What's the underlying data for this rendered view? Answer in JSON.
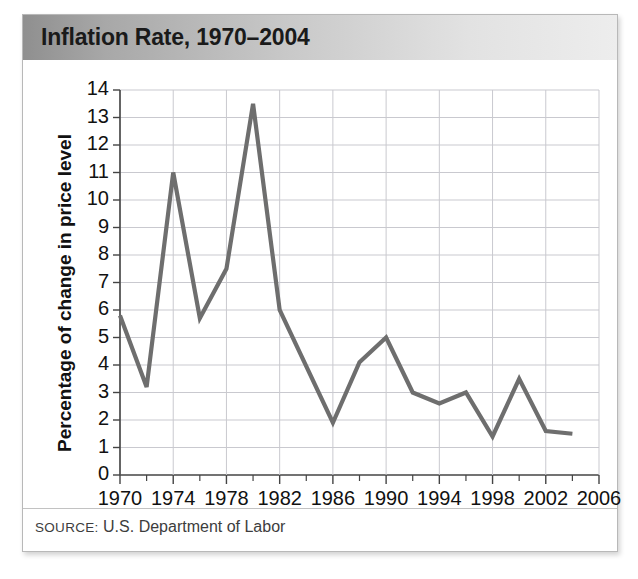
{
  "figure": {
    "title": "Inflation Rate, 1970–2004",
    "source_label": "SOURCE:",
    "source_text": "U.S. Department of Labor",
    "accent_line_color": "#6e6e6e",
    "grid_color": "#c9c9cf",
    "axis_color": "#444444",
    "title_bar_left_color": "#8f8f8f",
    "title_bar_right_color": "#ededed"
  },
  "chart_data": {
    "type": "line",
    "title": "Inflation Rate, 1970–2004",
    "xlabel": "",
    "ylabel": "Percentage of change in price level",
    "xlim": [
      1970,
      2006
    ],
    "ylim": [
      0,
      14
    ],
    "grid": true,
    "legend": "none",
    "x_tick_labels": [
      "1970",
      "1974",
      "1978",
      "1982",
      "1986",
      "1990",
      "1994",
      "1998",
      "2002",
      "2006"
    ],
    "x_major_ticks": [
      1970,
      1974,
      1978,
      1982,
      1986,
      1990,
      1994,
      1998,
      2002,
      2006
    ],
    "x_minor_ticks": [
      1972,
      1976,
      1980,
      1984,
      1988,
      1992,
      1996,
      2000,
      2004
    ],
    "y_tick_labels": [
      "0",
      "1",
      "2",
      "3",
      "4",
      "5",
      "6",
      "7",
      "8",
      "9",
      "10",
      "11",
      "12",
      "13",
      "14"
    ],
    "y_ticks": [
      0,
      1,
      2,
      3,
      4,
      5,
      6,
      7,
      8,
      9,
      10,
      11,
      12,
      13,
      14
    ],
    "series": [
      {
        "name": "Inflation rate",
        "color": "#6e6e6e",
        "x": [
          1970,
          1972,
          1974,
          1976,
          1978,
          1980,
          1982,
          1986,
          1988,
          1990,
          1992,
          1994,
          1996,
          1998,
          2000,
          2002,
          2004
        ],
        "values": [
          5.8,
          3.2,
          11.0,
          5.7,
          7.5,
          13.5,
          6.0,
          1.9,
          4.1,
          5.0,
          3.0,
          2.6,
          3.0,
          1.4,
          3.5,
          1.6,
          1.5
        ]
      }
    ]
  }
}
